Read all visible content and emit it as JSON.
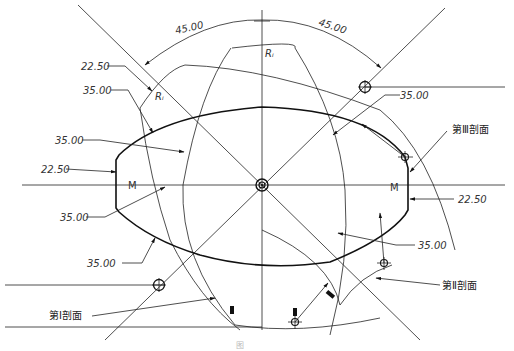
{
  "figure": {
    "caption": "图",
    "dimensions": {
      "angle_left": "45.00",
      "angle_right": "45.00",
      "radius_top": "Rᵢ",
      "radius_left": "Rᵢ",
      "left_22_50_top": "22.50",
      "left_35_00_upper": "35.00",
      "left_35_00_mid": "35.00",
      "left_22_50_mid": "22.50",
      "left_35_00_lower": "35.00",
      "left_35_00_bottom": "35.00",
      "right_35_00_top": "35.00",
      "right_22_50": "22.50",
      "right_35_00_lower": "35.00"
    },
    "markers": {
      "left_M": "M",
      "right_M": "M"
    },
    "section_labels": {
      "section_1": "第Ⅰ剖面",
      "section_2": "第Ⅱ剖面",
      "section_3": "第Ⅲ剖面"
    },
    "colors": {
      "line": "#222222",
      "text": "#333333",
      "background": "#ffffff"
    }
  }
}
